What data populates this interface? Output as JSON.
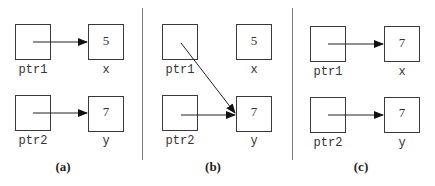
{
  "panels": [
    {
      "caption": "(a)",
      "pointers": [
        {
          "name": "ptr1",
          "target": "x"
        },
        {
          "name": "ptr2",
          "target": "y"
        }
      ],
      "variables": [
        {
          "name": "x",
          "value": "5"
        },
        {
          "name": "y",
          "value": "7"
        }
      ]
    },
    {
      "caption": "(b)",
      "pointers": [
        {
          "name": "ptr1",
          "target": "y"
        },
        {
          "name": "ptr2",
          "target": "y"
        }
      ],
      "variables": [
        {
          "name": "x",
          "value": "5"
        },
        {
          "name": "y",
          "value": "7"
        }
      ]
    },
    {
      "caption": "(c)",
      "pointers": [
        {
          "name": "ptr1",
          "target": "x"
        },
        {
          "name": "ptr2",
          "target": "y"
        }
      ],
      "variables": [
        {
          "name": "x",
          "value": "7"
        },
        {
          "name": "y",
          "value": "7"
        }
      ]
    }
  ],
  "colors": {
    "line": "#222222",
    "divider": "#7a7a7a",
    "background": "#ffffff"
  }
}
